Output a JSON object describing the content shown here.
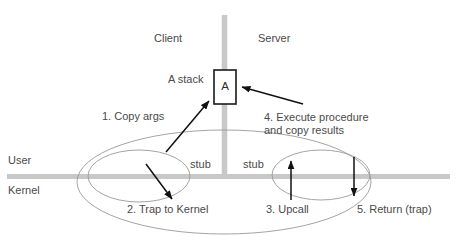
{
  "diagram": {
    "colors": {
      "divider_gray": "#c8c8c8",
      "ellipse_stroke": "#9a9a9a",
      "arrow_black": "#111111",
      "text_gray": "#4a4a4a",
      "box_stroke": "#1a1a1a",
      "background": "#ffffff"
    },
    "regions": {
      "client_label": "Client",
      "server_label": "Server",
      "user_label": "User",
      "kernel_label": "Kernel"
    },
    "stack": {
      "stack_label": "A stack",
      "box_label": "A"
    },
    "stubs": [
      {
        "label": "stub",
        "side": "client"
      },
      {
        "label": "stub",
        "side": "server"
      }
    ],
    "steps": [
      {
        "number": "1",
        "text": "1. Copy args"
      },
      {
        "number": "2",
        "text": "2. Trap to Kernel"
      },
      {
        "number": "3",
        "text": "3. Upcall"
      },
      {
        "number": "4",
        "text": "4. Execute procedure\nand copy results"
      },
      {
        "number": "5",
        "text": "5. Return (trap)"
      }
    ]
  }
}
